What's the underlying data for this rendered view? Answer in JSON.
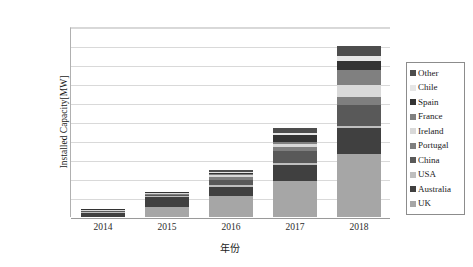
{
  "chart_data": {
    "type": "bar",
    "subtype": "stacked-bar",
    "title": "",
    "xlabel": "年份",
    "ylabel": "Installed Capacity[MW]",
    "categories": [
      "2014",
      "2015",
      "2016",
      "2017",
      "2018"
    ],
    "ylim": [
      0,
      100
    ],
    "ytick_labels": [
      "0.0",
      "10.0",
      "20.0",
      "30.0",
      "40.0",
      "50.0",
      "60.0",
      "70.0",
      "80.0",
      "90.0",
      "100.0"
    ],
    "ytick_values": [
      0,
      10,
      20,
      30,
      40,
      50,
      60,
      70,
      80,
      90,
      100
    ],
    "grid": true,
    "legend_position": "right",
    "totals": [
      4.3,
      13.2,
      25.0,
      47.0,
      90.0
    ],
    "series": [
      {
        "name": "UK",
        "color": "#a6a6a6",
        "values": [
          0.0,
          5.5,
          11.0,
          19.0,
          33.0
        ]
      },
      {
        "name": "Australia",
        "color": "#404040",
        "values": [
          2.0,
          5.0,
          5.0,
          8.5,
          14.0
        ]
      },
      {
        "name": "USA",
        "color": "#bfbfbf",
        "values": [
          0.4,
          0.6,
          0.6,
          1.0,
          1.0
        ]
      },
      {
        "name": "China",
        "color": "#595959",
        "values": [
          0.6,
          0.6,
          3.0,
          6.0,
          11.0
        ]
      },
      {
        "name": "Portugal",
        "color": "#7f7f7f",
        "values": [
          0.4,
          0.5,
          1.5,
          2.5,
          4.0
        ]
      },
      {
        "name": "Ireland",
        "color": "#d9d9d9",
        "values": [
          0.3,
          0.4,
          1.0,
          1.5,
          6.5
        ]
      },
      {
        "name": "France",
        "color": "#808080",
        "values": [
          0.2,
          0.2,
          0.5,
          1.0,
          8.0
        ]
      },
      {
        "name": "Spain",
        "color": "#333333",
        "values": [
          0.2,
          0.2,
          0.6,
          3.5,
          4.5
        ]
      },
      {
        "name": "Chile",
        "color": "#e6e6e6",
        "values": [
          0.1,
          0.1,
          0.3,
          1.0,
          3.0
        ]
      },
      {
        "name": "Other",
        "color": "#4d4d4d",
        "values": [
          0.1,
          0.1,
          1.5,
          3.0,
          5.0
        ]
      }
    ]
  },
  "legend": {
    "items": [
      {
        "label": "Other",
        "color": "#4d4d4d"
      },
      {
        "label": "Chile",
        "color": "#e6e6e6"
      },
      {
        "label": "Spain",
        "color": "#333333"
      },
      {
        "label": "France",
        "color": "#808080"
      },
      {
        "label": "Ireland",
        "color": "#d9d9d9"
      },
      {
        "label": "Portugal",
        "color": "#7f7f7f"
      },
      {
        "label": "China",
        "color": "#595959"
      },
      {
        "label": "USA",
        "color": "#bfbfbf"
      },
      {
        "label": "Australia",
        "color": "#404040"
      },
      {
        "label": "UK",
        "color": "#a6a6a6"
      }
    ]
  }
}
